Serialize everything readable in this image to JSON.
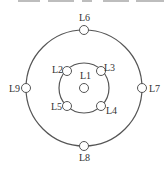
{
  "diagram": {
    "type": "concentric-circles-node-layout",
    "colors": {
      "line": "#555555",
      "node_fill": "#ffffff",
      "text": "#333333"
    },
    "outer_circle": {
      "cx": 84,
      "cy": 88,
      "r": 58
    },
    "inner_circle": {
      "cx": 84,
      "cy": 88,
      "r": 25
    },
    "nodes": [
      {
        "id": "L1",
        "label": "L1",
        "x": 84,
        "y": 88,
        "lx": 80,
        "ly": 79
      },
      {
        "id": "L2",
        "label": "L2",
        "x": 67,
        "y": 71,
        "lx": 52,
        "ly": 73
      },
      {
        "id": "L3",
        "label": "L3",
        "x": 101,
        "y": 71,
        "lx": 104,
        "ly": 71
      },
      {
        "id": "L4",
        "label": "L4",
        "x": 101,
        "y": 106,
        "lx": 106,
        "ly": 114
      },
      {
        "id": "L5",
        "label": "L5",
        "x": 67,
        "y": 106,
        "lx": 51,
        "ly": 110
      },
      {
        "id": "L6",
        "label": "L6",
        "x": 84,
        "y": 30,
        "lx": 79,
        "ly": 21
      },
      {
        "id": "L7",
        "label": "L7",
        "x": 142,
        "y": 88,
        "lx": 149,
        "ly": 92
      },
      {
        "id": "L8",
        "label": "L8",
        "x": 84,
        "y": 146,
        "lx": 79,
        "ly": 161
      },
      {
        "id": "L9",
        "label": "L9",
        "x": 26,
        "y": 88,
        "lx": 9,
        "ly": 92
      }
    ],
    "node_radius": 4.5
  }
}
